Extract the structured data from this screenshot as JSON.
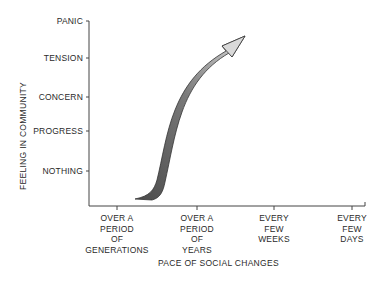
{
  "diagram": {
    "y_axis": {
      "title": "FEELING IN COMMUNITY",
      "levels": [
        "PANIC",
        "TENSION",
        "CONCERN",
        "PROGRESS",
        "NOTHING"
      ]
    },
    "x_axis": {
      "title": "PACE OF SOCIAL CHANGES",
      "categories": [
        {
          "line1": "OVER A",
          "line2": "PERIOD",
          "line3": "OF",
          "line4": "GENERATIONS"
        },
        {
          "line1": "OVER A",
          "line2": "PERIOD",
          "line3": "OF",
          "line4": "YEARS"
        },
        {
          "line1": "EVERY",
          "line2": "FEW",
          "line3": "WEEKS",
          "line4": ""
        },
        {
          "line1": "EVERY",
          "line2": "FEW",
          "line3": "DAYS",
          "line4": ""
        }
      ]
    },
    "arrow": {
      "description": "Curved shaded ribbon arrow rising from bottom near 'over a period of generations' steeply up toward 'panic' near 'over a period of years'",
      "colors": {
        "dark": "#5a5a5a",
        "light": "#d9d9d9",
        "outline": "#333333"
      }
    }
  }
}
